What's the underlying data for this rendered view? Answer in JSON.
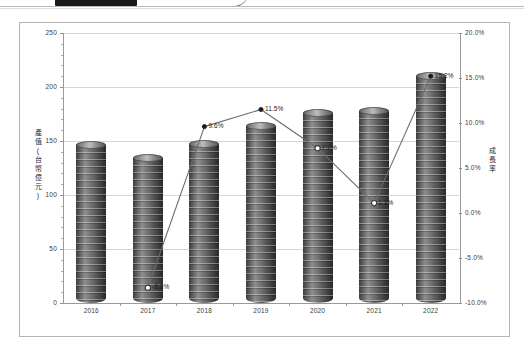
{
  "window": {
    "top_strip_present": true
  },
  "chart_data": {
    "type": "bar",
    "title": "",
    "subtitle": "",
    "categories": [
      "2016",
      "2017",
      "2018",
      "2019",
      "2020",
      "2021",
      "2022"
    ],
    "xlabel": "",
    "grid": true,
    "legend": "none",
    "series": [
      {
        "name": "產值",
        "type": "bar",
        "axis": "left",
        "values": [
          146,
          134,
          147,
          164,
          176,
          178,
          210
        ],
        "color": "#5a5a5a"
      },
      {
        "name": "成長率",
        "type": "line",
        "axis": "right",
        "values": [
          null,
          -8.3,
          9.6,
          11.5,
          7.2,
          1.1,
          15.2
        ],
        "labels": [
          "",
          "-8.3%",
          "9.6%",
          "11.5%",
          "7.2%",
          "1.1%",
          "15.2%"
        ],
        "color": "#6b6b6b",
        "marker_filled": [
          false,
          false,
          true,
          true,
          false,
          false,
          true
        ]
      }
    ],
    "left_axis": {
      "label": "產值(台幣億元)",
      "label_chars": [
        "產",
        "值",
        "(",
        "台",
        "幣",
        "億",
        "元",
        ")"
      ],
      "ticks": [
        "250",
        "200",
        "150",
        "100",
        "50",
        "0"
      ],
      "values": [
        250,
        200,
        150,
        100,
        50,
        0
      ],
      "ylim": [
        0,
        250
      ]
    },
    "right_axis": {
      "label": "成長率",
      "label_chars": [
        "成",
        "長",
        "率"
      ],
      "ticks": [
        "20.0%",
        "15.0%",
        "10.0%",
        "5.0%",
        "0.0%",
        "-5.0%",
        "-10.0%"
      ],
      "values": [
        20.0,
        15.0,
        10.0,
        5.0,
        0.0,
        -5.0,
        -10.0
      ],
      "ylim": [
        -10.0,
        20.0
      ]
    }
  }
}
